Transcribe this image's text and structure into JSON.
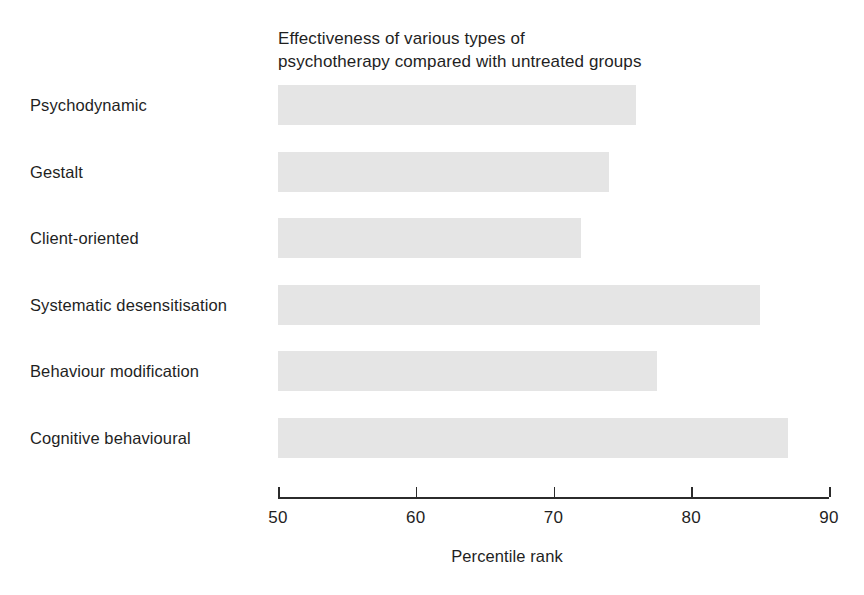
{
  "chart_data": {
    "type": "bar",
    "orientation": "horizontal",
    "title": "Effectiveness of various types of\npsychotherapy compared with untreated groups",
    "xlabel": "Percentile rank",
    "ylabel": "",
    "xlim": [
      50,
      90
    ],
    "xticks": [
      50,
      60,
      70,
      80,
      90
    ],
    "xtick_labels": [
      "50",
      "60",
      "70",
      "80",
      "90"
    ],
    "grid": false,
    "legend": null,
    "bar_color": "#e5e5e5",
    "axis_color": "#2b2b2b",
    "text_color": "#1f1f1f",
    "categories": [
      "Psychodynamic",
      "Gestalt",
      "Client-oriented",
      "Systematic desensitisation",
      "Behaviour modification",
      "Cognitive behavioural"
    ],
    "values": [
      76,
      74,
      72,
      85,
      77.5,
      87
    ]
  }
}
